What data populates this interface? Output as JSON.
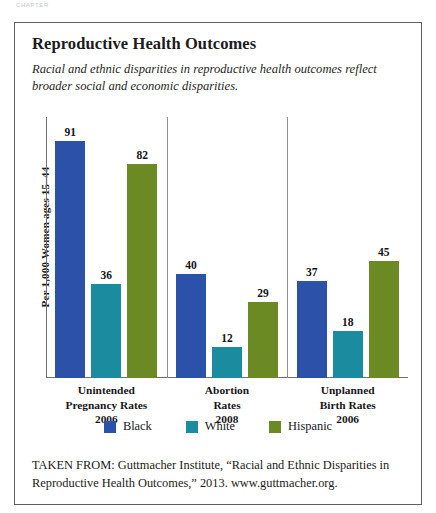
{
  "page": {
    "running_head": "Chapter"
  },
  "figure": {
    "title": "Reproductive Health Outcomes",
    "subtitle": "Racial and ethnic disparities in reproductive health outcomes reflect broader social and economic disparities.",
    "caption": "TAKEN FROM: Guttmacher Institute, “Racial and Ethnic Disparities in Reproductive Health Outcomes,” 2013. www.guttmacher.org."
  },
  "chart_data": {
    "type": "bar",
    "title": "Reproductive Health Outcomes",
    "subtitle": "Racial and ethnic disparities in reproductive health outcomes reflect broader social and economic disparities.",
    "xlabel": "",
    "ylabel": "Per 1,000 Women ages 15–44",
    "ylim": [
      0,
      100
    ],
    "grid": false,
    "legend_position": "bottom",
    "categories": [
      "Unintended Pregnancy Rates 2006",
      "Abortion Rates 2008",
      "Unplanned Birth Rates 2006"
    ],
    "category_lines": [
      [
        "Unintended",
        "Pregnancy Rates",
        "2006"
      ],
      [
        "Abortion",
        "Rates",
        "2008"
      ],
      [
        "Unplanned",
        "Birth Rates",
        "2006"
      ]
    ],
    "series": [
      {
        "name": "Black",
        "color": "#2b51a8",
        "values": [
          91,
          40,
          37
        ]
      },
      {
        "name": "White",
        "color": "#1b8ba0",
        "values": [
          36,
          12,
          18
        ]
      },
      {
        "name": "Hispanic",
        "color": "#6b8a23",
        "values": [
          82,
          29,
          45
        ]
      }
    ]
  },
  "colors": {
    "black_series": "#2b51a8",
    "white_series": "#1b8ba0",
    "hispanic_series": "#6b8a23",
    "frame": "#5d5f66",
    "axis": "#6e7076"
  }
}
